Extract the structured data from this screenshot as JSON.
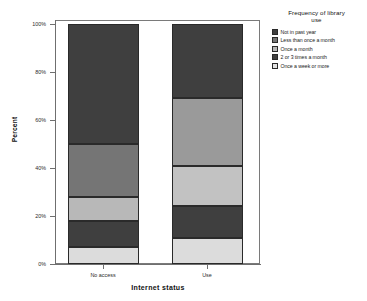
{
  "chart_data": {
    "type": "bar",
    "subtype": "stacked-100-percent",
    "title": "",
    "xlabel": "Internet status",
    "ylabel": "Percent",
    "categories": [
      "No access",
      "Use"
    ],
    "ylim": [
      0,
      100
    ],
    "ytick_labels": [
      "0%",
      "20%",
      "40%",
      "60%",
      "80%",
      "100%"
    ],
    "ytick_values": [
      0,
      20,
      40,
      60,
      80,
      100
    ],
    "grid": false,
    "legend_position": "right",
    "legend_title": "Frequency of library use",
    "series": [
      {
        "name": "Not in past year",
        "color": "#3f3f3f",
        "values": [
          50,
          31
        ]
      },
      {
        "name": "Less than once a month",
        "color": "#757575",
        "values": [
          22,
          28
        ]
      },
      {
        "name": "Once a month",
        "color": "#b8b8b8",
        "values": [
          10,
          17
        ]
      },
      {
        "name": "2 or 3 times a month",
        "color": "#3f3f3f",
        "values": [
          11,
          13
        ]
      },
      {
        "name": "Once a week or more",
        "color": "#dcdcdc",
        "values": [
          7,
          11
        ]
      }
    ],
    "cumulative_tops": {
      "No access": [
        100,
        50,
        28,
        18,
        7
      ],
      "Use": [
        100,
        69,
        41,
        24,
        11
      ]
    }
  },
  "axes": {
    "y_title": "Percent",
    "x_title": "Internet status",
    "y_ticks": [
      {
        "label": "100%",
        "value": 100
      },
      {
        "label": "80%",
        "value": 80
      },
      {
        "label": "60%",
        "value": 60
      },
      {
        "label": "40%",
        "value": 40
      },
      {
        "label": "20%",
        "value": 20
      },
      {
        "label": "0%",
        "value": 0
      }
    ],
    "x_ticks": [
      {
        "label": "No access"
      },
      {
        "label": "Use"
      }
    ]
  },
  "legend": {
    "title_line1": "Frequency of library",
    "title_line2": "use",
    "items": [
      {
        "label": "Not in past year",
        "color": "#3f3f3f"
      },
      {
        "label": "Less than once a month",
        "color": "#757575"
      },
      {
        "label": "Once a month",
        "color": "#b8b8b8"
      },
      {
        "label": "2 or 3 times a month",
        "color": "#3f3f3f"
      },
      {
        "label": "Once a week or more",
        "color": "#e2e2e2"
      }
    ]
  }
}
